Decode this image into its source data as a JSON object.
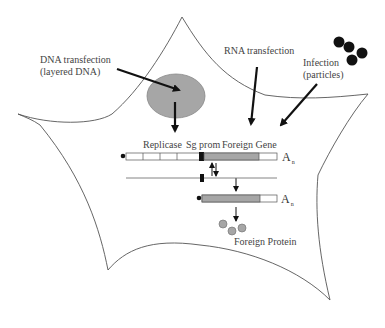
{
  "diagram": {
    "type": "cell-schematic"
  },
  "labels": {
    "dna_transfection_line1": "DNA transfection",
    "dna_transfection_line2": "(layered DNA)",
    "rna_transfection": "RNA transfection",
    "infection_line1": "Infection",
    "infection_line2": "(particles)",
    "replicase": "Replicase",
    "sg_prom": "Sg prom",
    "foreign_gene": "Foreign Gene",
    "poly_a_1": "A",
    "poly_a_1_sub": "n",
    "poly_a_2": "A",
    "poly_a_2_sub": "n",
    "foreign_protein": "Foreign Protein"
  },
  "nodes": [
    {
      "id": "cell",
      "shape": "irregular-cell-outline"
    },
    {
      "id": "nucleus",
      "shape": "ellipse",
      "fill": "#a6a6a6"
    },
    {
      "id": "particles",
      "shape": "circle-cluster",
      "count": 4,
      "fill": "#111111"
    },
    {
      "id": "genomic-rna",
      "shape": "segmented-bar",
      "segments": [
        "Replicase x4",
        "Sg prom",
        "Foreign Gene",
        "3' end"
      ]
    },
    {
      "id": "negative-strand",
      "shape": "line-with-marker"
    },
    {
      "id": "subgenomic-rna",
      "shape": "bar",
      "segments": [
        "Foreign Gene",
        "3' end"
      ]
    },
    {
      "id": "foreign-protein",
      "shape": "circle-cluster",
      "count": 3,
      "fill": "#a6a6a6"
    }
  ],
  "edges": [
    {
      "from": "dna_transfection",
      "to": "nucleus"
    },
    {
      "from": "nucleus",
      "to": "genomic-rna"
    },
    {
      "from": "rna_transfection",
      "to": "genomic-rna"
    },
    {
      "from": "infection",
      "to": "genomic-rna"
    },
    {
      "from": "genomic-rna",
      "to": "negative-strand",
      "bidirectional": true
    },
    {
      "from": "negative-strand",
      "to": "subgenomic-rna"
    },
    {
      "from": "subgenomic-rna",
      "to": "foreign-protein"
    }
  ],
  "colors": {
    "outline": "#555555",
    "arrow": "#111111",
    "gray_fill": "#a6a6a6",
    "white_fill": "#ffffff",
    "black_fill": "#111111"
  }
}
